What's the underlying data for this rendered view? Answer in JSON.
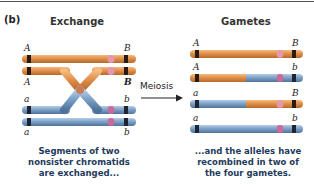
{
  "panel_label": "(b)",
  "left": {
    "title": "Exchange",
    "chromatids": [
      {
        "left_allele": "A",
        "right_allele": "B",
        "color": "orange"
      },
      {
        "left_allele": "A",
        "right_allele": "B",
        "color": "orange",
        "crossover": true
      },
      {
        "left_allele": "a",
        "right_allele": "b",
        "color": "blue",
        "crossover": true
      },
      {
        "left_allele": "a",
        "right_allele": "b",
        "color": "blue"
      }
    ],
    "caption": [
      "Segments of two",
      "nonsister chromatids",
      "are exchanged..."
    ]
  },
  "arrow_label": "Meiosis",
  "right": {
    "title": "Gametes",
    "chromatids": [
      {
        "left_allele": "A",
        "right_allele": "B",
        "composition": "orange"
      },
      {
        "left_allele": "A",
        "right_allele": "b",
        "composition": "orange-left, blue-right"
      },
      {
        "left_allele": "a",
        "right_allele": "B",
        "composition": "blue-left, orange-right"
      },
      {
        "left_allele": "a",
        "right_allele": "b",
        "composition": "blue"
      }
    ],
    "caption": [
      "...and the alleles have",
      "recombined in two of",
      "the four gametes."
    ]
  },
  "colors": {
    "orange": "#d98a3e",
    "orange_light": "#f0b070",
    "blue": "#6f95c0",
    "blue_light": "#a9c3e0",
    "band": "#2a1a12",
    "centromere": "#d77a9a",
    "caption_text": "#1e3a5c"
  }
}
